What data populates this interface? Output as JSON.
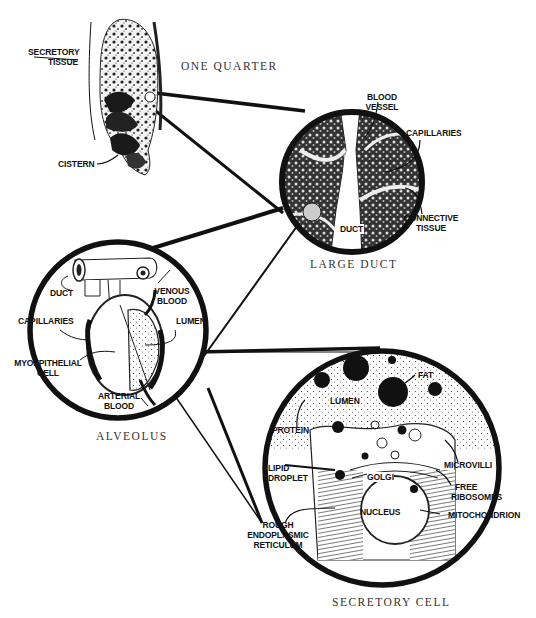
{
  "diagram": {
    "panels": {
      "quarter": {
        "title": "ONE QUARTER",
        "labels": {
          "secretory_tissue_1": "SECRETORY",
          "secretory_tissue_2": "TISSUE",
          "cistern": "CISTERN"
        }
      },
      "large_duct": {
        "title": "LARGE DUCT",
        "labels": {
          "blood_vessel_1": "BLOOD",
          "blood_vessel_2": "VESSEL",
          "capillaries": "CAPILLARIES",
          "connective_tissue_1": "CONNECTIVE",
          "connective_tissue_2": "TISSUE",
          "duct": "DUCT"
        }
      },
      "alveolus": {
        "title": "ALVEOLUS",
        "labels": {
          "duct": "DUCT",
          "venous_blood_1": "VENOUS",
          "venous_blood_2": "BLOOD",
          "capillaries": "CAPILLARIES",
          "lumen": "LUMEN",
          "myoepithelial_cell_1": "MYOEPITHELIAL",
          "myoepithelial_cell_2": "CELL",
          "arterial_blood_1": "ARTERIAL",
          "arterial_blood_2": "BLOOD"
        }
      },
      "secretory_cell": {
        "title": "SECRETORY CELL",
        "labels": {
          "fat": "FAT",
          "lumen": "LUMEN",
          "protein": "PROTEIN",
          "microvilli": "MICROVILLI",
          "lipid_droplet_1": "LIPID",
          "lipid_droplet_2": "DROPLET",
          "golgi": "GOLGI",
          "free_ribosomes_1": "FREE",
          "free_ribosomes_2": "RIBOSOMES",
          "nucleus": "NUCLEUS",
          "mitochondrion": "MITOCHONDRION",
          "rough_er_1": "ROUGH",
          "rough_er_2": "ENDOPLASMIC",
          "rough_er_3": "RETICULUM"
        }
      }
    },
    "colors": {
      "ink": "#111111",
      "background": "#ffffff",
      "title_text": "#333333"
    }
  }
}
